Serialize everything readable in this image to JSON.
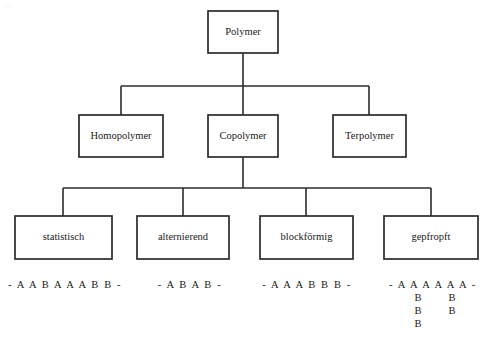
{
  "diagram": {
    "canvas": {
      "width": 490,
      "height": 347
    },
    "colors": {
      "background": "#ffffff",
      "stroke": "#2b2b2b",
      "text": "#1a1a1a",
      "box_fill": "#ffffff"
    },
    "levels": [
      {
        "level": 1,
        "nodes": [
          {
            "id": "polymer",
            "label": "Polymer",
            "x": 208,
            "y": 11,
            "w": 70,
            "h": 42
          }
        ]
      },
      {
        "level": 2,
        "nodes": [
          {
            "id": "homopolymer",
            "label": "Homopolymer",
            "x": 79,
            "y": 115,
            "w": 84,
            "h": 42
          },
          {
            "id": "copolymer",
            "label": "Copolymer",
            "x": 208,
            "y": 115,
            "w": 70,
            "h": 42
          },
          {
            "id": "terpolymer",
            "label": "Terpolymer",
            "x": 333,
            "y": 115,
            "w": 73,
            "h": 42
          }
        ]
      },
      {
        "level": 3,
        "nodes": [
          {
            "id": "statistisch",
            "label": "statistisch",
            "x": 15,
            "y": 216,
            "w": 97,
            "h": 43
          },
          {
            "id": "alternierend",
            "label": "alternierend",
            "x": 137,
            "y": 216,
            "w": 92,
            "h": 43
          },
          {
            "id": "blockfoermig",
            "label": "blockförmig",
            "x": 260,
            "y": 216,
            "w": 93,
            "h": 43
          },
          {
            "id": "gepfropft",
            "label": "gepfropft",
            "x": 384,
            "y": 216,
            "w": 94,
            "h": 43
          }
        ]
      }
    ],
    "connectors": {
      "level2_bus_y": 86,
      "level3_bus_y": 188,
      "root_stem": {
        "x": 243,
        "y1": 53,
        "y2": 86
      },
      "copolymer_stem": {
        "x": 243,
        "y1": 157,
        "y2": 188
      },
      "level2_bus_x1": 121,
      "level2_bus_x2": 369,
      "level3_bus_x1": 63,
      "level3_bus_x2": 431,
      "level2_drops": [
        {
          "x": 121,
          "y1": 86,
          "y2": 115
        },
        {
          "x": 243,
          "y1": 86,
          "y2": 115
        },
        {
          "x": 369,
          "y1": 86,
          "y2": 115
        }
      ],
      "level3_drops": [
        {
          "x": 63,
          "y1": 188,
          "y2": 216
        },
        {
          "x": 183,
          "y1": 188,
          "y2": 216
        },
        {
          "x": 306,
          "y1": 188,
          "y2": 216
        },
        {
          "x": 431,
          "y1": 188,
          "y2": 216
        }
      ]
    },
    "sequences": [
      {
        "id": "seq-statistisch",
        "for_node": "statistisch",
        "text": "- A A B A A A B B -",
        "cx": 65,
        "y": 288
      },
      {
        "id": "seq-alternierend",
        "for_node": "alternierend",
        "text": "- A B A B -",
        "cx": 190,
        "y": 288
      },
      {
        "id": "seq-blockfoermig",
        "for_node": "blockfoermig",
        "text": "- A A A B B B -",
        "cx": 307,
        "y": 288
      },
      {
        "id": "seq-gepfropft",
        "for_node": "gepfropft",
        "text": "- A A A A A A -",
        "cx": 433,
        "y": 288
      }
    ],
    "graft_branches": {
      "id": "gepfropft-side-chains",
      "monomer": "B",
      "columns": [
        {
          "x": 418,
          "ys": [
            301,
            314,
            327
          ],
          "labels": [
            "B",
            "B",
            "B"
          ]
        },
        {
          "x": 452,
          "ys": [
            301,
            314
          ],
          "labels": [
            "B",
            "B"
          ]
        }
      ]
    },
    "corner_mark": "(a)"
  }
}
